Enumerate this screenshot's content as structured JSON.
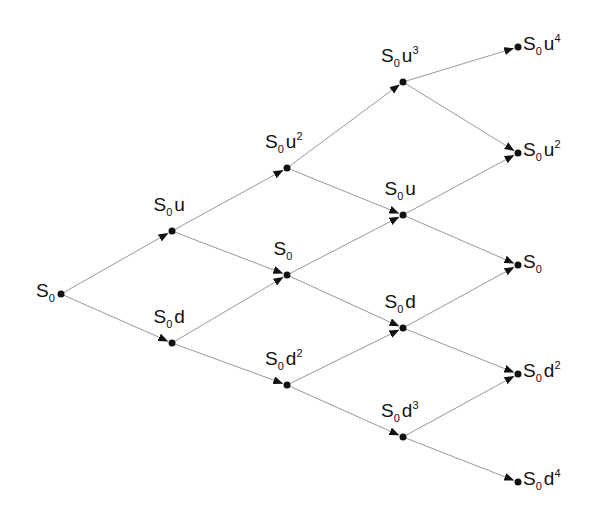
{
  "diagram": {
    "colors": {
      "edge": "#999999",
      "node": "#111111",
      "arrow": "#111111",
      "text": "#111111"
    },
    "nodes": [
      {
        "id": "n00",
        "x": 61,
        "y": 294,
        "base": "S",
        "sub": "0",
        "var": "",
        "exp": "",
        "label_pos": "left"
      },
      {
        "id": "n10",
        "x": 172,
        "y": 231,
        "base": "S",
        "sub": "0",
        "var": "u",
        "exp": "",
        "label_pos": "above"
      },
      {
        "id": "n11",
        "x": 172,
        "y": 343,
        "base": "S",
        "sub": "0",
        "var": "d",
        "exp": "",
        "label_pos": "above"
      },
      {
        "id": "n20",
        "x": 287,
        "y": 168,
        "base": "S",
        "sub": "0",
        "var": "u",
        "exp": "2",
        "label_pos": "above"
      },
      {
        "id": "n21",
        "x": 287,
        "y": 275,
        "base": "S",
        "sub": "0",
        "var": "",
        "exp": "",
        "label_pos": "above"
      },
      {
        "id": "n22",
        "x": 287,
        "y": 385,
        "base": "S",
        "sub": "0",
        "var": "d",
        "exp": "2",
        "label_pos": "above"
      },
      {
        "id": "n30",
        "x": 403,
        "y": 82,
        "base": "S",
        "sub": "0",
        "var": "u",
        "exp": "3",
        "label_pos": "above"
      },
      {
        "id": "n31",
        "x": 403,
        "y": 215,
        "base": "S",
        "sub": "0",
        "var": "u",
        "exp": "",
        "label_pos": "above"
      },
      {
        "id": "n32",
        "x": 403,
        "y": 328,
        "base": "S",
        "sub": "0",
        "var": "d",
        "exp": "",
        "label_pos": "above"
      },
      {
        "id": "n33",
        "x": 403,
        "y": 437,
        "base": "S",
        "sub": "0",
        "var": "d",
        "exp": "3",
        "label_pos": "above"
      },
      {
        "id": "n40",
        "x": 518,
        "y": 47,
        "base": "S",
        "sub": "0",
        "var": "u",
        "exp": "4",
        "label_pos": "right"
      },
      {
        "id": "n41",
        "x": 518,
        "y": 153,
        "base": "S",
        "sub": "0",
        "var": "u",
        "exp": "2",
        "label_pos": "right"
      },
      {
        "id": "n42",
        "x": 518,
        "y": 265,
        "base": "S",
        "sub": "0",
        "var": "",
        "exp": "",
        "label_pos": "right"
      },
      {
        "id": "n43",
        "x": 518,
        "y": 374,
        "base": "S",
        "sub": "0",
        "var": "d",
        "exp": "2",
        "label_pos": "right"
      },
      {
        "id": "n44",
        "x": 518,
        "y": 482,
        "base": "S",
        "sub": "0",
        "var": "d",
        "exp": "4",
        "label_pos": "right"
      }
    ],
    "edges": [
      [
        "n00",
        "n10"
      ],
      [
        "n00",
        "n11"
      ],
      [
        "n10",
        "n20"
      ],
      [
        "n10",
        "n21"
      ],
      [
        "n11",
        "n21"
      ],
      [
        "n11",
        "n22"
      ],
      [
        "n20",
        "n30"
      ],
      [
        "n20",
        "n31"
      ],
      [
        "n21",
        "n31"
      ],
      [
        "n21",
        "n32"
      ],
      [
        "n22",
        "n32"
      ],
      [
        "n22",
        "n33"
      ],
      [
        "n30",
        "n40"
      ],
      [
        "n30",
        "n41"
      ],
      [
        "n31",
        "n41"
      ],
      [
        "n31",
        "n42"
      ],
      [
        "n32",
        "n42"
      ],
      [
        "n32",
        "n43"
      ],
      [
        "n33",
        "n43"
      ],
      [
        "n33",
        "n44"
      ]
    ]
  }
}
